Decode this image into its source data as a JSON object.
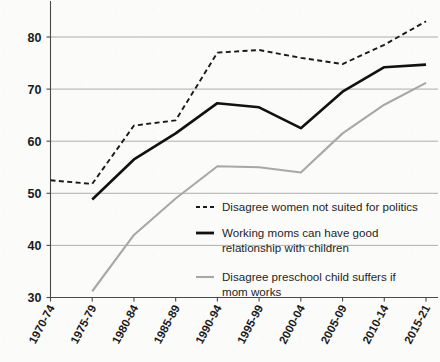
{
  "chart_data": {
    "type": "line",
    "title": "",
    "subtitle": "",
    "xlabel": "",
    "ylabel": "",
    "categories": [
      "1970-74",
      "1975-79",
      "1980-84",
      "1985-89",
      "1990-94",
      "1995-99",
      "2000-04",
      "2005-09",
      "2010-14",
      "2015-21"
    ],
    "ylim": [
      30,
      85
    ],
    "yticks": [
      30,
      40,
      50,
      60,
      70,
      80
    ],
    "yticklabels": [
      "30",
      "40",
      "50",
      "60",
      "70",
      "80"
    ],
    "grid": true,
    "legend_position": "center-right-inside",
    "series": [
      {
        "name": "Disagree women not suited for politics",
        "style": "dashed",
        "color": "#1a1a1a",
        "values": [
          52.5,
          51.8,
          63.0,
          64.0,
          77.0,
          77.5,
          76.0,
          74.8,
          78.5,
          83.0
        ]
      },
      {
        "name": "Working moms can have good relationship with children",
        "style": "solid",
        "color": "#111111",
        "values": [
          null,
          48.8,
          56.5,
          61.5,
          67.3,
          66.5,
          62.5,
          69.5,
          74.2,
          74.7
        ]
      },
      {
        "name": "Disagree preschool child suffers if mom works",
        "style": "solid",
        "color": "#a8a8a8",
        "values": [
          null,
          31.2,
          42.0,
          49.0,
          55.2,
          55.0,
          54.0,
          61.5,
          67.0,
          71.2
        ]
      }
    ]
  },
  "legend": {
    "entries": [
      {
        "label_line1": "Disagree women not suited for politics",
        "label_line2": "",
        "marker": "dashed-line-marker",
        "color": "#1a1a1a"
      },
      {
        "label_line1": "Working moms can have good",
        "label_line2": "relationship with children",
        "marker": "solid-black-line-marker",
        "color": "#111111"
      },
      {
        "label_line1": "Disagree preschool child suffers if",
        "label_line2": "mom works",
        "marker": "solid-gray-line-marker",
        "color": "#a8a8a8"
      }
    ]
  },
  "colors": {
    "background": "#fbfbfa",
    "grid": "#9b9b9b",
    "axis": "#4a4a4a",
    "series_dashed": "#1a1a1a",
    "series_solid_dark": "#111111",
    "series_solid_gray": "#a8a8a8",
    "text": "#1a1a1a"
  }
}
